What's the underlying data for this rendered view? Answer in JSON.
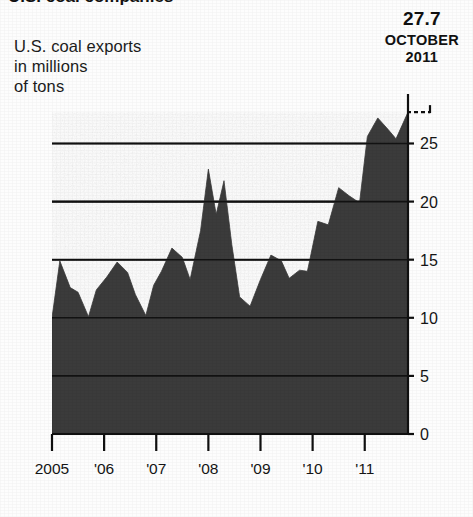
{
  "headline": {
    "text": "U.S. coal companies"
  },
  "caption": {
    "line1": "U.S. coal exports",
    "line2": "in millions",
    "line3": "of tons"
  },
  "callout": {
    "value": "27.7",
    "month": "OCTOBER",
    "year": "2011"
  },
  "colors": {
    "area_fill": "#3a3a3a",
    "gridline": "#101010",
    "axis": "#101010",
    "text": "#151515",
    "background": "#fdfdfd"
  },
  "chart_data": {
    "type": "area",
    "title": "U.S. coal exports in millions of tons",
    "xlabel": "",
    "ylabel": "millions of tons",
    "ylim": [
      0,
      29
    ],
    "xlim": [
      2005,
      2011.83
    ],
    "grid": true,
    "legend": "none",
    "yticks": [
      "0",
      "5",
      "10",
      "15",
      "20",
      "25"
    ],
    "ytick_values": [
      0,
      5,
      10,
      15,
      20,
      25
    ],
    "xticks": [
      "2005",
      "'06",
      "'07",
      "'08",
      "'09",
      "'10",
      "'11"
    ],
    "xtick_values": [
      2005,
      2006,
      2007,
      2008,
      2009,
      2010,
      2011
    ],
    "annotation": {
      "label": "27.7 OCTOBER 2011",
      "x": 2011.83,
      "y": 27.7,
      "leader": "dashed"
    },
    "series": [
      {
        "name": "U.S. coal exports",
        "x": [
          2005.0,
          2005.15,
          2005.35,
          2005.5,
          2005.7,
          2005.85,
          2006.05,
          2006.25,
          2006.45,
          2006.6,
          2006.8,
          2006.95,
          2007.1,
          2007.3,
          2007.5,
          2007.65,
          2007.85,
          2008.0,
          2008.15,
          2008.3,
          2008.45,
          2008.6,
          2008.8,
          2009.0,
          2009.2,
          2009.4,
          2009.55,
          2009.75,
          2009.9,
          2010.1,
          2010.3,
          2010.5,
          2010.7,
          2010.9,
          2011.05,
          2011.25,
          2011.45,
          2011.6,
          2011.83
        ],
        "values": [
          10.0,
          14.9,
          12.6,
          12.2,
          10.1,
          12.4,
          13.5,
          14.8,
          13.9,
          12.0,
          10.2,
          12.8,
          14.0,
          16.0,
          15.2,
          13.3,
          17.5,
          22.8,
          18.9,
          21.8,
          16.3,
          11.8,
          11.0,
          13.3,
          15.4,
          14.9,
          13.4,
          14.1,
          14.0,
          18.3,
          18.0,
          21.2,
          20.5,
          19.9,
          25.6,
          27.2,
          26.2,
          25.4,
          27.7
        ]
      }
    ]
  }
}
